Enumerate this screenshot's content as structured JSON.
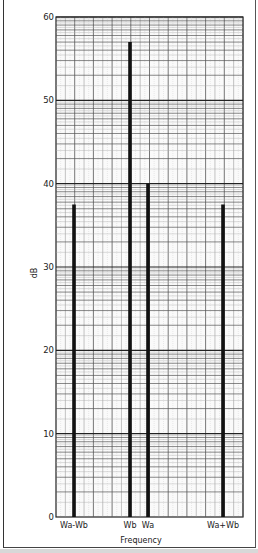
{
  "chart_data": {
    "type": "bar",
    "title": "",
    "xlabel": "Frequency",
    "ylabel": "dB",
    "ylim": [
      0,
      60
    ],
    "yticks": [
      0,
      10,
      20,
      30,
      40,
      50,
      60
    ],
    "grid": true,
    "legend": null,
    "categories": [
      "Wa-Wb",
      "Wb",
      "Wa",
      "Wa+Wb"
    ],
    "values": [
      37.5,
      57,
      40,
      37.5
    ],
    "bar_color": "#111111"
  }
}
